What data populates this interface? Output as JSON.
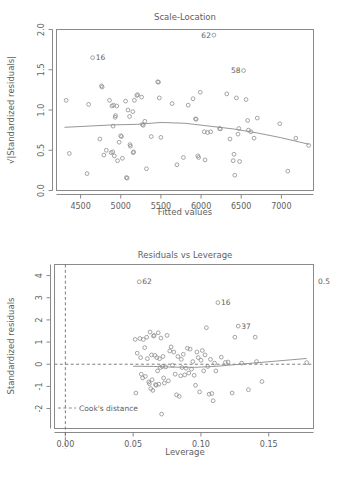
{
  "figure": {
    "background": "#ffffff",
    "point_color": "#8e8e8e",
    "line_color": "#8a8a8a",
    "text_color": "#5e5e5e"
  },
  "chart_data": [
    {
      "id": "scale-location",
      "type": "scatter",
      "title": "Scale-Location",
      "xlabel": "Fitted values",
      "ylabel": "√|Standardized residuals|",
      "xlim": [
        4200,
        7400
      ],
      "ylim": [
        0.0,
        2.0
      ],
      "xticks": [
        4500,
        5000,
        5500,
        6000,
        6500,
        7000
      ],
      "xtick_labels": [
        "4500",
        "5000",
        "5500",
        "6000",
        "6500",
        "7000"
      ],
      "yticks": [
        0.0,
        0.5,
        1.0,
        1.5,
        2.0
      ],
      "ytick_labels": [
        "0.0",
        "0.5",
        "1.0",
        "1.5",
        "2.0"
      ],
      "grid": false,
      "legend": "none",
      "annotations": [
        {
          "label": "62",
          "x": 6160,
          "y": 1.93,
          "side": "left"
        },
        {
          "label": "16",
          "x": 4650,
          "y": 1.65,
          "side": "right"
        },
        {
          "label": "58",
          "x": 6530,
          "y": 1.49,
          "side": "left"
        }
      ],
      "points": [
        [
          4320,
          1.12
        ],
        [
          4360,
          0.46
        ],
        [
          4580,
          0.21
        ],
        [
          4600,
          1.07
        ],
        [
          4650,
          1.65
        ],
        [
          4740,
          0.64
        ],
        [
          4760,
          1.3
        ],
        [
          4768,
          1.285
        ],
        [
          4790,
          0.44
        ],
        [
          4820,
          0.5
        ],
        [
          4860,
          1.12
        ],
        [
          4880,
          0.47
        ],
        [
          4890,
          1.05
        ],
        [
          4900,
          0.48
        ],
        [
          4905,
          0.8
        ],
        [
          4910,
          1.06
        ],
        [
          4920,
          0.43
        ],
        [
          4930,
          0.91
        ],
        [
          4935,
          0.93
        ],
        [
          4950,
          1.05
        ],
        [
          4960,
          0.37
        ],
        [
          4980,
          0.6
        ],
        [
          5000,
          0.68
        ],
        [
          5010,
          0.67
        ],
        [
          5020,
          0.4
        ],
        [
          5060,
          1.11
        ],
        [
          5070,
          0.16
        ],
        [
          5080,
          0.155
        ],
        [
          5090,
          1.0
        ],
        [
          5110,
          0.92
        ],
        [
          5115,
          0.57
        ],
        [
          5120,
          0.55
        ],
        [
          5150,
          0.98
        ],
        [
          5155,
          0.47
        ],
        [
          5160,
          0.48
        ],
        [
          5170,
          1.12
        ],
        [
          5200,
          1.18
        ],
        [
          5210,
          1.19
        ],
        [
          5260,
          1.16
        ],
        [
          5270,
          0.82
        ],
        [
          5280,
          0.81
        ],
        [
          5300,
          0.86
        ],
        [
          5320,
          0.27
        ],
        [
          5380,
          0.67
        ],
        [
          5460,
          1.35
        ],
        [
          5470,
          1.345
        ],
        [
          5480,
          1.15
        ],
        [
          5500,
          0.66
        ],
        [
          5640,
          1.08
        ],
        [
          5700,
          0.32
        ],
        [
          5780,
          0.41
        ],
        [
          5840,
          1.06
        ],
        [
          5900,
          1.14
        ],
        [
          5930,
          0.89
        ],
        [
          5940,
          0.885
        ],
        [
          5960,
          0.43
        ],
        [
          5970,
          0.41
        ],
        [
          5990,
          1.22
        ],
        [
          6040,
          0.73
        ],
        [
          6050,
          0.38
        ],
        [
          6080,
          0.72
        ],
        [
          6120,
          0.73
        ],
        [
          6160,
          1.93
        ],
        [
          6230,
          0.77
        ],
        [
          6240,
          0.765
        ],
        [
          6320,
          1.2
        ],
        [
          6360,
          0.64
        ],
        [
          6400,
          0.37
        ],
        [
          6410,
          0.45
        ],
        [
          6420,
          0.19
        ],
        [
          6440,
          1.15
        ],
        [
          6460,
          0.7
        ],
        [
          6470,
          0.77
        ],
        [
          6480,
          0.36
        ],
        [
          6530,
          1.49
        ],
        [
          6560,
          1.13
        ],
        [
          6580,
          0.87
        ],
        [
          6590,
          0.75
        ],
        [
          6620,
          0.73
        ],
        [
          6660,
          0.65
        ],
        [
          6700,
          0.9
        ],
        [
          6980,
          0.83
        ],
        [
          7080,
          0.24
        ],
        [
          7180,
          0.65
        ],
        [
          7340,
          0.56
        ]
      ],
      "smoother": [
        [
          4300,
          0.785
        ],
        [
          4600,
          0.8
        ],
        [
          4900,
          0.815
        ],
        [
          5200,
          0.822
        ],
        [
          5500,
          0.845
        ],
        [
          5800,
          0.835
        ],
        [
          6100,
          0.8
        ],
        [
          6400,
          0.765
        ],
        [
          6700,
          0.715
        ],
        [
          7000,
          0.655
        ],
        [
          7340,
          0.575
        ]
      ]
    },
    {
      "id": "residuals-leverage",
      "type": "scatter",
      "title": "Residuals vs Leverage",
      "xlabel": "Leverage",
      "ylabel": "Standardized residuals",
      "xlim": [
        -0.008,
        0.183
      ],
      "ylim": [
        -2.9,
        4.5
      ],
      "xticks": [
        0.0,
        0.05,
        0.1,
        0.15
      ],
      "xtick_labels": [
        "0.00",
        "0.05",
        "0.10",
        "0.15"
      ],
      "yticks": [
        -2,
        -1,
        0,
        1,
        2,
        3,
        4
      ],
      "ytick_labels": [
        "-2",
        "-1",
        "0",
        "1",
        "2",
        "3",
        "4"
      ],
      "grid": false,
      "legend": "Cook's distance",
      "cooks_contour_label": "0.5",
      "annotations": [
        {
          "label": "62",
          "x": 0.0545,
          "y": 3.72,
          "side": "right"
        },
        {
          "label": "16",
          "x": 0.1125,
          "y": 2.78,
          "side": "right"
        },
        {
          "label": "37",
          "x": 0.1275,
          "y": 1.72,
          "side": "right"
        }
      ],
      "points": [
        [
          0.0515,
          1.12
        ],
        [
          0.052,
          -1.3
        ],
        [
          0.053,
          0.5
        ],
        [
          0.0545,
          3.72
        ],
        [
          0.055,
          1.16
        ],
        [
          0.0555,
          0.3
        ],
        [
          0.056,
          -0.45
        ],
        [
          0.057,
          -0.62
        ],
        [
          0.0575,
          1.12
        ],
        [
          0.0585,
          0.75
        ],
        [
          0.059,
          -0.55
        ],
        [
          0.06,
          1.22
        ],
        [
          0.0605,
          0.25
        ],
        [
          0.0615,
          -0.8
        ],
        [
          0.062,
          -0.88
        ],
        [
          0.0625,
          1.45
        ],
        [
          0.063,
          -1.1
        ],
        [
          0.0635,
          0.42
        ],
        [
          0.064,
          -0.7
        ],
        [
          0.0645,
          -1.18
        ],
        [
          0.065,
          1.27
        ],
        [
          0.0655,
          1.3
        ],
        [
          0.066,
          0.4
        ],
        [
          0.0665,
          -0.92
        ],
        [
          0.067,
          -0.95
        ],
        [
          0.0675,
          0.3
        ],
        [
          0.068,
          -0.3
        ],
        [
          0.0685,
          1.42
        ],
        [
          0.069,
          -0.9
        ],
        [
          0.0695,
          0.25
        ],
        [
          0.07,
          -0.15
        ],
        [
          0.0705,
          1.18
        ],
        [
          0.071,
          -2.25
        ],
        [
          0.0715,
          -0.1
        ],
        [
          0.072,
          0.35
        ],
        [
          0.0725,
          -0.62
        ],
        [
          0.073,
          -0.85
        ],
        [
          0.074,
          -0.12
        ],
        [
          0.075,
          1.3
        ],
        [
          0.076,
          -0.75
        ],
        [
          0.077,
          0.6
        ],
        [
          0.078,
          0.78
        ],
        [
          0.079,
          -0.05
        ],
        [
          0.08,
          0.55
        ],
        [
          0.081,
          -0.45
        ],
        [
          0.082,
          -1.38
        ],
        [
          0.083,
          0.35
        ],
        [
          0.084,
          -1.45
        ],
        [
          0.085,
          -0.52
        ],
        [
          0.0855,
          0.22
        ],
        [
          0.086,
          -0.15
        ],
        [
          0.087,
          0.45
        ],
        [
          0.088,
          -0.48
        ],
        [
          0.089,
          -0.18
        ],
        [
          0.09,
          0.72
        ],
        [
          0.091,
          -0.4
        ],
        [
          0.092,
          0.68
        ],
        [
          0.093,
          -0.22
        ],
        [
          0.094,
          0.12
        ],
        [
          0.095,
          -0.5
        ],
        [
          0.096,
          -0.95
        ],
        [
          0.097,
          0.55
        ],
        [
          0.098,
          0.3
        ],
        [
          0.099,
          -1.25
        ],
        [
          0.1,
          0.18
        ],
        [
          0.101,
          0.62
        ],
        [
          0.102,
          -0.3
        ],
        [
          0.103,
          0.42
        ],
        [
          0.104,
          1.65
        ],
        [
          0.105,
          -0.1
        ],
        [
          0.106,
          -1.35
        ],
        [
          0.107,
          0.22
        ],
        [
          0.108,
          -1.32
        ],
        [
          0.109,
          -1.65
        ],
        [
          0.11,
          0.05
        ],
        [
          0.111,
          -0.3
        ],
        [
          0.1125,
          2.78
        ],
        [
          0.115,
          0.32
        ],
        [
          0.118,
          0.08
        ],
        [
          0.12,
          0.1
        ],
        [
          0.123,
          -1.3
        ],
        [
          0.125,
          1.22
        ],
        [
          0.1275,
          1.72
        ],
        [
          0.13,
          0.05
        ],
        [
          0.135,
          -1.15
        ],
        [
          0.14,
          1.22
        ],
        [
          0.141,
          0.12
        ],
        [
          0.145,
          -0.78
        ],
        [
          0.178,
          0.07
        ]
      ],
      "smoother": [
        [
          0.05,
          -0.09
        ],
        [
          0.065,
          -0.1
        ],
        [
          0.08,
          -0.13
        ],
        [
          0.095,
          -0.14
        ],
        [
          0.11,
          -0.1
        ],
        [
          0.125,
          -0.02
        ],
        [
          0.14,
          0.06
        ],
        [
          0.155,
          0.14
        ],
        [
          0.178,
          0.26
        ]
      ],
      "hline_y": 0,
      "vline_x": 0.0
    }
  ]
}
